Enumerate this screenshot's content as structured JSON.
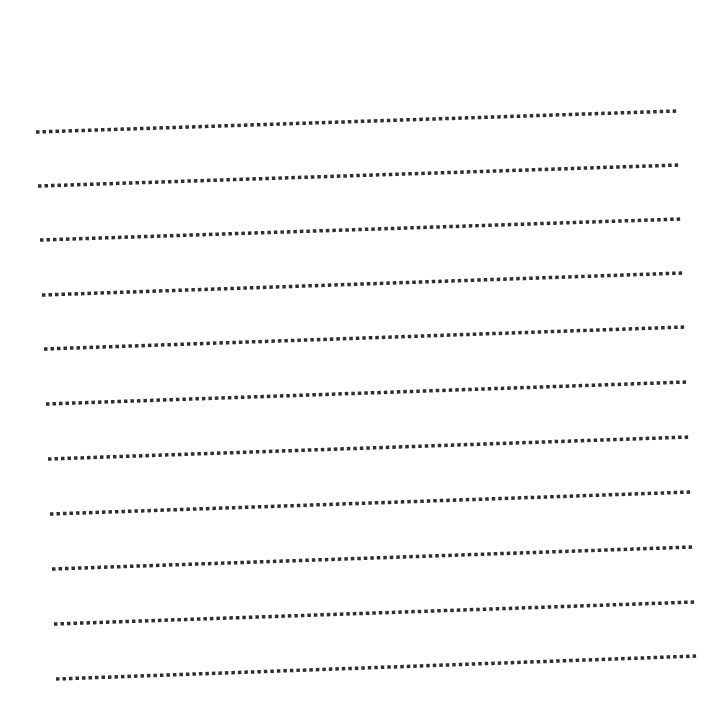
{
  "page": {
    "background": "#ffffff",
    "width": 726,
    "height": 722
  },
  "style": {
    "dot_color": "#2e2e2e",
    "dot_size": 3.5,
    "dot_gap": 3
  },
  "writing_lines": [
    {
      "x1": 36,
      "y1": 132,
      "x2": 677,
      "y2": 111
    },
    {
      "x1": 38,
      "y1": 186,
      "x2": 679,
      "y2": 165
    },
    {
      "x1": 40,
      "y1": 240,
      "x2": 681,
      "y2": 219
    },
    {
      "x1": 42,
      "y1": 295,
      "x2": 683,
      "y2": 273
    },
    {
      "x1": 44,
      "y1": 349,
      "x2": 685,
      "y2": 327
    },
    {
      "x1": 46,
      "y1": 404,
      "x2": 687,
      "y2": 382
    },
    {
      "x1": 48,
      "y1": 459,
      "x2": 689,
      "y2": 437
    },
    {
      "x1": 50,
      "y1": 514,
      "x2": 691,
      "y2": 492
    },
    {
      "x1": 52,
      "y1": 569,
      "x2": 693,
      "y2": 547
    },
    {
      "x1": 54,
      "y1": 624,
      "x2": 695,
      "y2": 602
    },
    {
      "x1": 56,
      "y1": 679,
      "x2": 697,
      "y2": 656
    }
  ]
}
